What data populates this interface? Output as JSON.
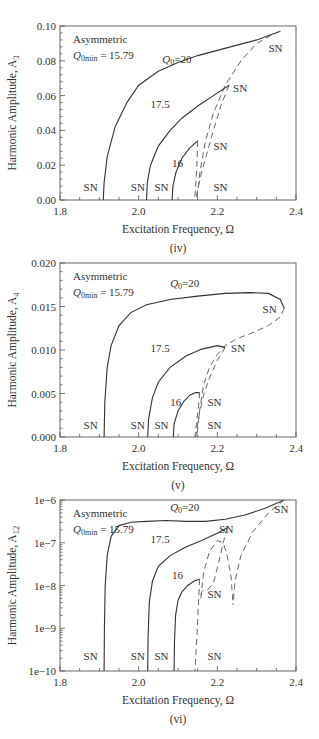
{
  "figure": {
    "panels_count": 3
  },
  "chart_data": [
    {
      "type": "line",
      "panel_label": "(iv)",
      "title": "",
      "xlabel": "Excitation Frequency, Ω",
      "ylabel": "Harmonic Amplitude, A3",
      "ylabel_main": "Harmonic Amplitude, A",
      "ylabel_sub": "3",
      "xlim": [
        1.8,
        2.4
      ],
      "ylim": [
        0.0,
        0.1
      ],
      "yscale": "linear",
      "xticks": [
        "1.8",
        "2.0",
        "2.2",
        "2.4"
      ],
      "yticks": [
        "0.00",
        "0.02",
        "0.04",
        "0.06",
        "0.08",
        "0.10"
      ],
      "grid": false,
      "annotation": {
        "line1": "Asymmetric",
        "line2_q": "Q",
        "line2_sub": "0min",
        "line2_rest": " = 15.79"
      },
      "series": [
        {
          "name": "Q0=20 stable",
          "style": "solid",
          "x": [
            1.91,
            1.912,
            1.92,
            1.94,
            1.97,
            2.0,
            2.05,
            2.1,
            2.15,
            2.2,
            2.25,
            2.3,
            2.36
          ],
          "y": [
            0.0,
            0.01,
            0.025,
            0.042,
            0.056,
            0.066,
            0.074,
            0.079,
            0.083,
            0.086,
            0.089,
            0.092,
            0.097
          ]
        },
        {
          "name": "Q0=20 unstable",
          "style": "dashed",
          "x": [
            2.36,
            2.34,
            2.3,
            2.26,
            2.22,
            2.19,
            2.17,
            2.155,
            2.148
          ],
          "y": [
            0.097,
            0.095,
            0.09,
            0.08,
            0.066,
            0.05,
            0.034,
            0.015,
            0.0
          ]
        },
        {
          "name": "Q0=17.5 stable",
          "style": "solid",
          "x": [
            2.02,
            2.022,
            2.03,
            2.05,
            2.08,
            2.11,
            2.15,
            2.19,
            2.23
          ],
          "y": [
            0.0,
            0.01,
            0.02,
            0.031,
            0.04,
            0.047,
            0.054,
            0.06,
            0.066
          ]
        },
        {
          "name": "Q0=17.5 unstable",
          "style": "dashed",
          "x": [
            2.23,
            2.21,
            2.19,
            2.175,
            2.16,
            2.15,
            2.145
          ],
          "y": [
            0.066,
            0.055,
            0.04,
            0.028,
            0.016,
            0.006,
            0.0
          ]
        },
        {
          "name": "Q0=16 stable",
          "style": "solid",
          "x": [
            2.085,
            2.087,
            2.095,
            2.11,
            2.13,
            2.15
          ],
          "y": [
            0.0,
            0.008,
            0.016,
            0.024,
            0.03,
            0.034
          ]
        },
        {
          "name": "Q0=16 unstable",
          "style": "dashed",
          "x": [
            2.15,
            2.148,
            2.145,
            2.142
          ],
          "y": [
            0.034,
            0.02,
            0.008,
            0.0
          ]
        }
      ],
      "labels": [
        {
          "text": "Q0=20",
          "x": 2.06,
          "y": 0.079,
          "kind": "q"
        },
        {
          "text": "17.5",
          "x": 2.03,
          "y": 0.053
        },
        {
          "text": "16",
          "x": 2.085,
          "y": 0.019
        },
        {
          "text": "SN",
          "x": 2.33,
          "y": 0.085
        },
        {
          "text": "SN",
          "x": 2.24,
          "y": 0.062
        },
        {
          "text": "SN",
          "x": 2.19,
          "y": 0.029
        },
        {
          "text": "SN",
          "x": 1.86,
          "y": 0.005
        },
        {
          "text": "SN",
          "x": 1.98,
          "y": 0.005
        },
        {
          "text": "SN",
          "x": 2.04,
          "y": 0.005
        },
        {
          "text": "SN",
          "x": 2.19,
          "y": 0.005
        }
      ]
    },
    {
      "type": "line",
      "panel_label": "(v)",
      "title": "",
      "xlabel": "Excitation Frequency, Ω",
      "ylabel": "Harmonic Amplitude, A4",
      "ylabel_main": "Harmonic Amplitude, A",
      "ylabel_sub": "4",
      "xlim": [
        1.8,
        2.4
      ],
      "ylim": [
        0.0,
        0.02
      ],
      "yscale": "linear",
      "xticks": [
        "1.8",
        "2.0",
        "2.2",
        "2.4"
      ],
      "yticks": [
        "0.000",
        "0.005",
        "0.010",
        "0.015",
        "0.020"
      ],
      "grid": false,
      "annotation": {
        "line1": "Asymmetric",
        "line2_q": "Q",
        "line2_sub": "0min",
        "line2_rest": " = 15.79"
      },
      "series": [
        {
          "name": "Q0=20 stable",
          "style": "solid",
          "x": [
            1.912,
            1.914,
            1.92,
            1.93,
            1.95,
            1.98,
            2.02,
            2.08,
            2.15,
            2.22,
            2.28,
            2.33,
            2.36,
            2.37
          ],
          "y": [
            0.0,
            0.004,
            0.008,
            0.0105,
            0.0128,
            0.0143,
            0.0152,
            0.0158,
            0.0162,
            0.0165,
            0.0166,
            0.0165,
            0.0158,
            0.0148
          ]
        },
        {
          "name": "Q0=20 unstable",
          "style": "dashed",
          "x": [
            2.37,
            2.36,
            2.33,
            2.29,
            2.25,
            2.22,
            2.2,
            2.18,
            2.165,
            2.155,
            2.148
          ],
          "y": [
            0.0148,
            0.0138,
            0.0128,
            0.012,
            0.0113,
            0.0105,
            0.0095,
            0.008,
            0.006,
            0.003,
            0.0
          ]
        },
        {
          "name": "Q0=17.5 stable",
          "style": "solid",
          "x": [
            2.023,
            2.025,
            2.035,
            2.05,
            2.08,
            2.12,
            2.16,
            2.2,
            2.22
          ],
          "y": [
            0.0,
            0.002,
            0.0045,
            0.0063,
            0.008,
            0.0093,
            0.0101,
            0.0105,
            0.0103
          ]
        },
        {
          "name": "Q0=17.5 unstable",
          "style": "dashed",
          "x": [
            2.22,
            2.2,
            2.18,
            2.165,
            2.155,
            2.148,
            2.145
          ],
          "y": [
            0.0103,
            0.0088,
            0.0068,
            0.0048,
            0.0028,
            0.001,
            0.0
          ]
        },
        {
          "name": "Q0=16 stable",
          "style": "solid",
          "x": [
            2.088,
            2.09,
            2.1,
            2.115,
            2.13,
            2.145,
            2.155
          ],
          "y": [
            0.0,
            0.0015,
            0.003,
            0.0041,
            0.0048,
            0.0051,
            0.0051
          ]
        },
        {
          "name": "Q0=16 unstable",
          "style": "dashed",
          "x": [
            2.155,
            2.152,
            2.148,
            2.145,
            2.143
          ],
          "y": [
            0.0051,
            0.0035,
            0.002,
            0.0008,
            0.0
          ]
        }
      ],
      "labels": [
        {
          "text": "Q0=20",
          "x": 2.08,
          "y": 0.0172,
          "kind": "q"
        },
        {
          "text": "17.5",
          "x": 2.03,
          "y": 0.0098
        },
        {
          "text": "16",
          "x": 2.08,
          "y": 0.0036
        },
        {
          "text": "SN",
          "x": 2.315,
          "y": 0.0143
        },
        {
          "text": "SN",
          "x": 2.235,
          "y": 0.0098
        },
        {
          "text": "SN",
          "x": 2.175,
          "y": 0.0036
        },
        {
          "text": "SN",
          "x": 1.86,
          "y": 0.0009
        },
        {
          "text": "SN",
          "x": 1.98,
          "y": 0.0009
        },
        {
          "text": "SN",
          "x": 2.04,
          "y": 0.0009
        },
        {
          "text": "SN",
          "x": 2.175,
          "y": 0.0009
        }
      ]
    },
    {
      "type": "line",
      "panel_label": "(vi)",
      "title": "",
      "xlabel": "Excitation Frequency, Ω",
      "ylabel": "Harmonic Amplitude, A12",
      "ylabel_main": "Harmonic Amplitude, A",
      "ylabel_sub": "12",
      "xlim": [
        1.8,
        2.4
      ],
      "ylim": [
        1e-10,
        1e-06
      ],
      "yscale": "log",
      "ylim_log": [
        -10,
        -6
      ],
      "xticks": [
        "1.8",
        "2.0",
        "2.2",
        "2.4"
      ],
      "yticks": [
        "1e−10",
        "1e−9",
        "1e−8",
        "1e−7",
        "1e−6"
      ],
      "grid": false,
      "annotation": {
        "line1": "Asymmetric",
        "line2_q": "Q",
        "line2_sub": "0min",
        "line2_rest": " = 15.79"
      },
      "series": [
        {
          "name": "Q0=20 stable",
          "style": "solid",
          "x_log": true,
          "x": [
            1.912,
            1.913,
            1.915,
            1.92,
            1.93,
            1.95,
            1.98,
            2.02,
            2.07,
            2.12,
            2.17,
            2.22,
            2.27,
            2.32,
            2.37
          ],
          "y": [
            -10,
            -9.0,
            -8.0,
            -7.3,
            -6.85,
            -6.6,
            -6.52,
            -6.5,
            -6.48,
            -6.5,
            -6.5,
            -6.45,
            -6.35,
            -6.2,
            -6.0
          ]
        },
        {
          "name": "Q0=20 unstable",
          "style": "dashed",
          "x": [
            2.37,
            2.33,
            2.29,
            2.26,
            2.245,
            2.24
          ],
          "y": [
            -6.0,
            -6.3,
            -6.75,
            -7.3,
            -7.9,
            -8.45
          ]
        },
        {
          "name": "Q0=17.5 stable",
          "style": "solid",
          "x": [
            2.023,
            2.024,
            2.027,
            2.035,
            2.05,
            2.08,
            2.12,
            2.16,
            2.2,
            2.225
          ],
          "y": [
            -10,
            -9.2,
            -8.4,
            -7.9,
            -7.55,
            -7.3,
            -7.1,
            -6.95,
            -6.78,
            -6.65
          ]
        },
        {
          "name": "Q0=17.5 unstable",
          "style": "dashed",
          "x": [
            2.225,
            2.215,
            2.205,
            2.19,
            2.175,
            2.165,
            2.16,
            2.158
          ],
          "y": [
            -6.65,
            -7.0,
            -7.4,
            -7.95,
            -8.1,
            -8.1,
            -8.15,
            -8.3
          ]
        },
        {
          "name": "Q0=17.5 unstable-b",
          "style": "dashed",
          "x": [
            2.158,
            2.165,
            2.18,
            2.2,
            2.215,
            2.225,
            2.235,
            2.24
          ],
          "y": [
            -8.3,
            -7.7,
            -7.2,
            -6.95,
            -7.0,
            -7.3,
            -7.8,
            -8.45
          ]
        },
        {
          "name": "Q0=16 stable",
          "style": "solid",
          "x": [
            2.09,
            2.091,
            2.094,
            2.1,
            2.11,
            2.125,
            2.14,
            2.155
          ],
          "y": [
            -10,
            -9.3,
            -8.7,
            -8.35,
            -8.15,
            -8.0,
            -7.9,
            -7.85
          ]
        },
        {
          "name": "Q0=16 unstable",
          "style": "dashed",
          "x": [
            2.155,
            2.152,
            2.149,
            2.146,
            2.144,
            2.143
          ],
          "y": [
            -7.85,
            -8.4,
            -9.0,
            -9.5,
            -9.85,
            -10
          ]
        }
      ],
      "labels": [
        {
          "text": "Q0=20",
          "x": 2.08,
          "y": -6.25,
          "kind": "q"
        },
        {
          "text": "17.5",
          "x": 2.03,
          "y": -7.0
        },
        {
          "text": "16",
          "x": 2.085,
          "y": -7.85
        },
        {
          "text": "SN",
          "x": 2.345,
          "y": -6.3
        },
        {
          "text": "SN",
          "x": 2.205,
          "y": -6.78
        },
        {
          "text": "SN",
          "x": 2.175,
          "y": -8.3
        },
        {
          "text": "SN",
          "x": 1.86,
          "y": -9.75
        },
        {
          "text": "SN",
          "x": 1.98,
          "y": -9.75
        },
        {
          "text": "SN",
          "x": 2.04,
          "y": -9.75
        },
        {
          "text": "SN",
          "x": 2.175,
          "y": -9.75
        }
      ]
    }
  ],
  "layout": {
    "panels": [
      {
        "left": 60,
        "top": 26,
        "right": 296,
        "bottom": 200
      },
      {
        "left": 60,
        "top": 263,
        "right": 296,
        "bottom": 437
      },
      {
        "left": 60,
        "top": 500,
        "right": 296,
        "bottom": 671
      }
    ]
  }
}
